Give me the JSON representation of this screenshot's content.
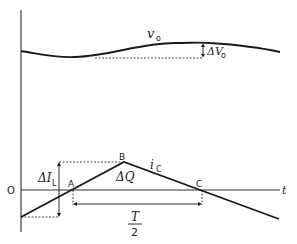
{
  "diagram": {
    "labels": {
      "vo": "v",
      "vo_sub": "o",
      "delta_vo": "ΔV",
      "delta_vo_sub": "o",
      "origin": "O",
      "t_axis": "t",
      "point_a": "A",
      "point_b": "B",
      "point_c": "C",
      "ic": "i",
      "ic_sub": "C",
      "delta_il": "ΔI",
      "delta_il_sub": "L",
      "delta_q": "ΔQ",
      "t_half_num": "T",
      "t_half_den": "2"
    },
    "colors": {
      "line": "#1a1a1a",
      "background": "#ffffff"
    }
  }
}
